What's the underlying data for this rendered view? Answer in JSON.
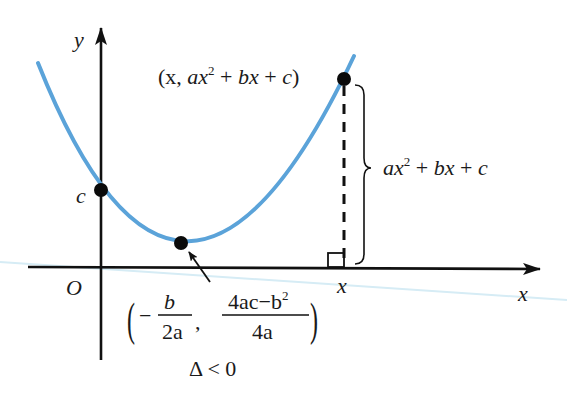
{
  "diagram": {
    "type": "quadratic-function-graph",
    "condition": "Δ < 0",
    "colors": {
      "curve": "#5ba3d9",
      "axes": "#111111",
      "points": "#0a0a0a",
      "faint_line": "#d6ecf5"
    },
    "axes": {
      "y_label": "y",
      "x_label": "x",
      "origin_label": "O"
    },
    "labels": {
      "y_intercept": "c",
      "point_on_curve": "(x,  ax² + bx + c)",
      "point_on_curve_parts": {
        "open": "(x,  ",
        "a": "a",
        "x2": "x",
        "sup": "2",
        "plus1": " + ",
        "b": "b",
        "x1": "x",
        "plus2": " + ",
        "c": "c",
        "close": ")"
      },
      "height_brace": "ax² + bx + c",
      "height_brace_parts": {
        "a": "a",
        "x2": "x",
        "sup": "2",
        "plus1": " + ",
        "b": "b",
        "x1": "x",
        "plus2": " + ",
        "c": "c"
      },
      "foot_x": "x",
      "vertex": {
        "open": "(",
        "minus": "−",
        "frac1_num": "b",
        "frac1_den": "2a",
        "comma": ",",
        "frac2_num": "4ac − b²",
        "frac2_num_parts": {
          "main": "4ac−b",
          "sup": "2"
        },
        "frac2_den": "4a",
        "close": ")"
      },
      "discriminant": "Δ < 0"
    },
    "points": [
      {
        "name": "y-intercept",
        "label": "c"
      },
      {
        "name": "vertex",
        "label": "(−b/2a, (4ac−b²)/4a)"
      },
      {
        "name": "point-on-curve",
        "label": "(x, ax²+bx+c)"
      }
    ]
  }
}
